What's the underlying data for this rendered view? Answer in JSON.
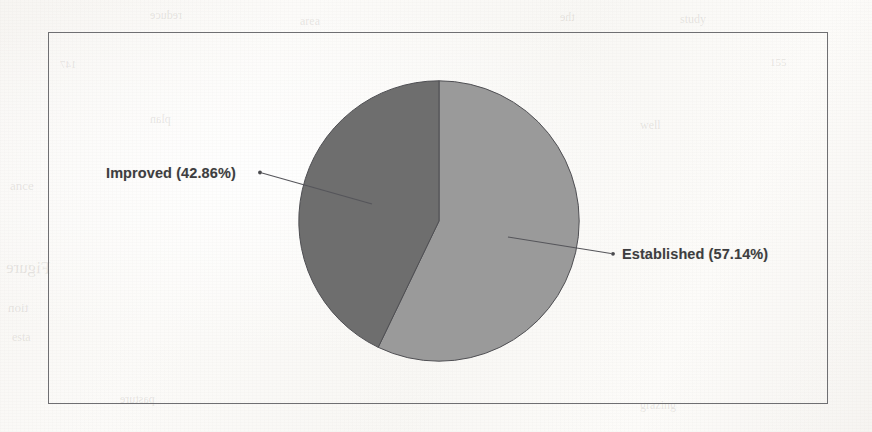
{
  "page": {
    "kind": "scanned-document-figure",
    "background_color": "#fbfaf8"
  },
  "frame": {
    "border_color": "#6f6f72"
  },
  "chart_data": {
    "type": "pie",
    "title": "",
    "subtitle": "",
    "xlabel": "",
    "ylabel": "",
    "grid": false,
    "legend_position": "none",
    "label_style": "callout-leader-line",
    "start_angle_deg": 0,
    "direction": "clockwise",
    "categories": [
      "Established",
      "Improved"
    ],
    "values": [
      57.14,
      42.86
    ],
    "value_unit": "percent",
    "labels": [
      "Established (57.14%)",
      "Improved (42.86%)"
    ],
    "colors": [
      "#9a9a9a",
      "#6e6e6e"
    ],
    "slices": [
      {
        "name": "Established",
        "label": "Established (57.14%)",
        "value": 57.14,
        "percent": "57.14%",
        "color": "#9a9a9a",
        "sweep_deg": 205.7,
        "start_deg": 0,
        "end_deg": 205.7
      },
      {
        "name": "Improved",
        "label": "Improved (42.86%)",
        "value": 42.86,
        "percent": "42.86%",
        "color": "#6e6e6e",
        "sweep_deg": 154.3,
        "start_deg": 205.7,
        "end_deg": 360
      }
    ]
  },
  "annotations": {
    "improved_label": "Improved (42.86%)",
    "established_label": "Established (57.14%)"
  },
  "ghost_text": [
    {
      "text": "Figure",
      "x": 6,
      "y": 258,
      "size": 17,
      "rot": -1
    },
    {
      "text": "ance",
      "x": 10,
      "y": 178,
      "size": 13,
      "rot": 0
    },
    {
      "text": "tion",
      "x": 8,
      "y": 300,
      "size": 13,
      "rot": 0
    },
    {
      "text": "esta",
      "x": 12,
      "y": 330,
      "size": 12,
      "rot": 0
    },
    {
      "text": "reduce",
      "x": 150,
      "y": 8,
      "size": 12,
      "rot": 0
    },
    {
      "text": "area",
      "x": 300,
      "y": 14,
      "size": 12,
      "rot": 0
    },
    {
      "text": "the",
      "x": 560,
      "y": 10,
      "size": 12,
      "rot": 0
    },
    {
      "text": "study",
      "x": 680,
      "y": 12,
      "size": 12,
      "rot": 0
    },
    {
      "text": "plan",
      "x": 150,
      "y": 112,
      "size": 12,
      "rot": 0
    },
    {
      "text": "well",
      "x": 640,
      "y": 118,
      "size": 12,
      "rot": 0
    },
    {
      "text": "pasture",
      "x": 120,
      "y": 392,
      "size": 12,
      "rot": 0
    },
    {
      "text": "grazing",
      "x": 640,
      "y": 398,
      "size": 12,
      "rot": 0
    },
    {
      "text": "147",
      "x": 60,
      "y": 58,
      "size": 11,
      "rot": 0
    },
    {
      "text": "155",
      "x": 770,
      "y": 56,
      "size": 11,
      "rot": 0
    }
  ]
}
